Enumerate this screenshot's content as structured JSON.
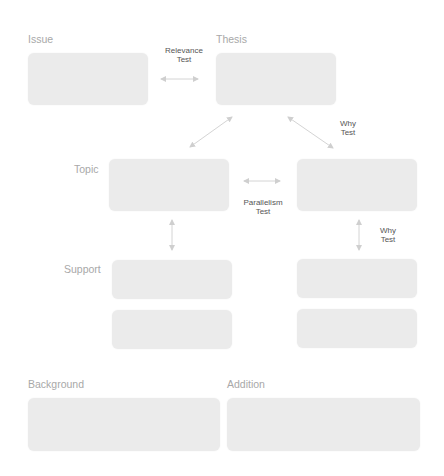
{
  "labels": {
    "issue": "Issue",
    "thesis": "Thesis",
    "topic": "Topic",
    "support": "Support",
    "background": "Background",
    "addition": "Addition"
  },
  "tests": {
    "relevance": {
      "line1": "Relevance",
      "line2": "Test"
    },
    "why_top": {
      "line1": "Why",
      "line2": "Test"
    },
    "parallelism": {
      "line1": "Parallelism",
      "line2": "Test"
    },
    "why_right": {
      "line1": "Why",
      "line2": "Test"
    }
  },
  "colors": {
    "box_fill": "#ebebeb",
    "label_text": "#a8a8a8",
    "test_text": "#555555",
    "arrow": "#cfcfcf"
  }
}
